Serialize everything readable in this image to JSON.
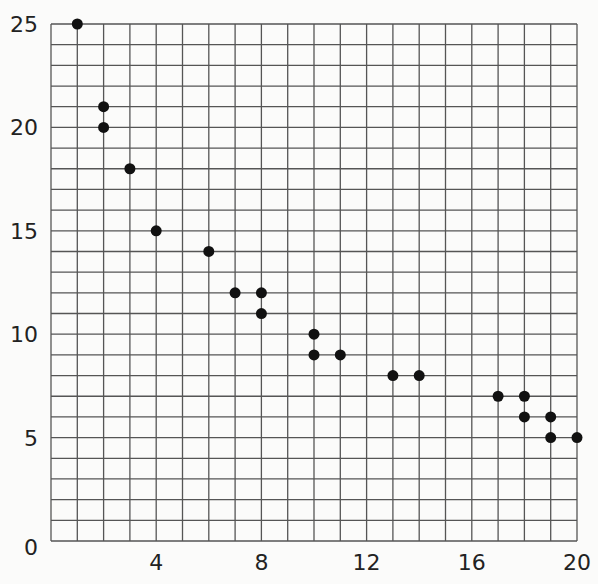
{
  "chart_data": {
    "type": "scatter",
    "title": "",
    "xlabel": "",
    "ylabel": "",
    "xlim": [
      0,
      20
    ],
    "ylim": [
      0,
      25
    ],
    "grid": true,
    "x_grid_step": 1,
    "y_grid_step": 1,
    "x_ticks": [
      4,
      8,
      12,
      16,
      20
    ],
    "y_ticks": [
      0,
      5,
      10,
      15,
      20,
      25
    ],
    "x_tick_labels": [
      "4",
      "8",
      "12",
      "16",
      "20"
    ],
    "y_tick_labels": [
      "0",
      "5",
      "10",
      "15",
      "20",
      "25"
    ],
    "points": [
      {
        "x": 1,
        "y": 25
      },
      {
        "x": 2,
        "y": 21
      },
      {
        "x": 2,
        "y": 20
      },
      {
        "x": 3,
        "y": 18
      },
      {
        "x": 4,
        "y": 15
      },
      {
        "x": 6,
        "y": 14
      },
      {
        "x": 7,
        "y": 12
      },
      {
        "x": 8,
        "y": 12
      },
      {
        "x": 8,
        "y": 11
      },
      {
        "x": 10,
        "y": 10
      },
      {
        "x": 10,
        "y": 9
      },
      {
        "x": 11,
        "y": 9
      },
      {
        "x": 13,
        "y": 8
      },
      {
        "x": 14,
        "y": 8
      },
      {
        "x": 17,
        "y": 7
      },
      {
        "x": 18,
        "y": 7
      },
      {
        "x": 18,
        "y": 6
      },
      {
        "x": 19,
        "y": 6
      },
      {
        "x": 19,
        "y": 5
      },
      {
        "x": 20,
        "y": 5
      }
    ],
    "colors": {
      "grid": "#555555",
      "point": "#111111",
      "text": "#222222"
    }
  }
}
